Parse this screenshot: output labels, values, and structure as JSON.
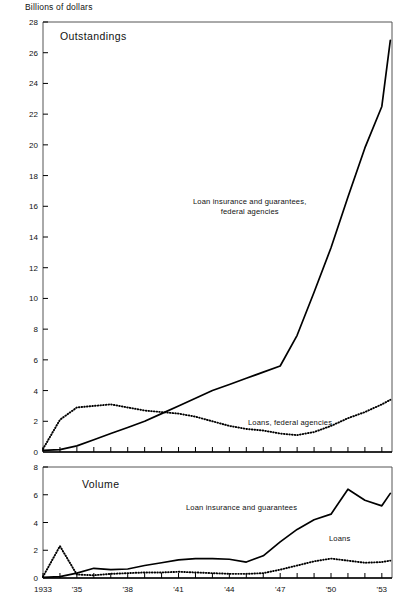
{
  "figure": {
    "axis_title": "Billions of dollars",
    "background": "#ffffff",
    "line_color": "#000000"
  },
  "panels": {
    "top": {
      "title": "Outstandings",
      "series_labels": {
        "insurance": "Loan insurance and guarantees,\nfederal agencies",
        "insurance_line1": "Loan insurance and guarantees,",
        "insurance_line2": "federal agencies",
        "loans": "Loans, federal agencies"
      }
    },
    "bottom": {
      "title": "Volume",
      "series_labels": {
        "insurance": "Loan insurance and guarantees",
        "loans": "Loans"
      }
    }
  },
  "chart_data": [
    {
      "type": "line",
      "title": "Outstandings",
      "xlabel": "",
      "ylabel": "Billions of dollars",
      "xlim": [
        1933,
        1953.6
      ],
      "ylim": [
        0,
        28
      ],
      "yticks": [
        0,
        2,
        4,
        6,
        8,
        10,
        12,
        14,
        16,
        18,
        20,
        22,
        24,
        26,
        28
      ],
      "ytick_labels": [
        "0",
        "2",
        "4",
        "6",
        "8",
        "10",
        "12",
        "14",
        "16",
        "18",
        "20",
        "22",
        "24",
        "26",
        "28"
      ],
      "xticks": [
        1933,
        1934,
        1935,
        1936,
        1937,
        1938,
        1939,
        1940,
        1941,
        1942,
        1943,
        1944,
        1945,
        1946,
        1947,
        1948,
        1949,
        1950,
        1951,
        1952,
        1953
      ],
      "xtick_labels": {
        "1933": "1933",
        "1935": "'35",
        "1938": "'38",
        "1941": "'41",
        "1944": "'44",
        "1947": "'47",
        "1950": "'50",
        "1953": "'53"
      },
      "grid": false,
      "legend": "inline-annotations",
      "x": [
        1933,
        1934,
        1935,
        1936,
        1937,
        1938,
        1939,
        1940,
        1941,
        1942,
        1943,
        1944,
        1945,
        1946,
        1947,
        1948,
        1949,
        1950,
        1951,
        1952,
        1953,
        1953.5
      ],
      "series": [
        {
          "name": "Loan insurance and guarantees, federal agencies",
          "style": "solid",
          "values": [
            0.1,
            0.15,
            0.4,
            0.8,
            1.2,
            1.6,
            2.0,
            2.5,
            3.0,
            3.5,
            4.0,
            4.4,
            4.8,
            5.2,
            5.6,
            7.6,
            10.4,
            13.3,
            16.6,
            19.8,
            22.5,
            26.8
          ]
        },
        {
          "name": "Loans, federal agencies",
          "style": "dotted",
          "values": [
            0.2,
            2.1,
            2.9,
            3.0,
            3.1,
            2.9,
            2.7,
            2.6,
            2.5,
            2.3,
            2.0,
            1.7,
            1.5,
            1.4,
            1.2,
            1.1,
            1.3,
            1.7,
            2.2,
            2.6,
            3.1,
            3.4
          ]
        }
      ]
    },
    {
      "type": "line",
      "title": "Volume",
      "xlabel": "",
      "ylabel": "",
      "xlim": [
        1933,
        1953.6
      ],
      "ylim": [
        0,
        8
      ],
      "yticks": [
        0,
        2,
        4,
        6,
        8
      ],
      "ytick_labels": [
        "0",
        "2",
        "4",
        "6",
        "8"
      ],
      "xticks": [
        1933,
        1934,
        1935,
        1936,
        1937,
        1938,
        1939,
        1940,
        1941,
        1942,
        1943,
        1944,
        1945,
        1946,
        1947,
        1948,
        1949,
        1950,
        1951,
        1952,
        1953
      ],
      "xtick_labels": {
        "1933": "1933",
        "1935": "'35",
        "1938": "'38",
        "1941": "'41",
        "1944": "'44",
        "1947": "'47",
        "1950": "'50",
        "1953": "'53"
      },
      "grid": false,
      "legend": "inline-annotations",
      "x": [
        1933,
        1934,
        1935,
        1936,
        1937,
        1938,
        1939,
        1940,
        1941,
        1942,
        1943,
        1944,
        1945,
        1946,
        1947,
        1948,
        1949,
        1950,
        1951,
        1952,
        1953,
        1953.5
      ],
      "series": [
        {
          "name": "Loan insurance and guarantees",
          "style": "solid",
          "values": [
            0.05,
            0.1,
            0.35,
            0.7,
            0.6,
            0.65,
            0.9,
            1.1,
            1.3,
            1.4,
            1.4,
            1.35,
            1.15,
            1.6,
            2.6,
            3.5,
            4.2,
            4.6,
            6.4,
            5.6,
            5.2,
            6.1
          ]
        },
        {
          "name": "Loans",
          "style": "dotted",
          "values": [
            0.1,
            2.3,
            0.25,
            0.2,
            0.3,
            0.35,
            0.4,
            0.4,
            0.45,
            0.4,
            0.35,
            0.3,
            0.3,
            0.35,
            0.6,
            0.9,
            1.2,
            1.4,
            1.25,
            1.1,
            1.15,
            1.25
          ]
        }
      ]
    }
  ]
}
